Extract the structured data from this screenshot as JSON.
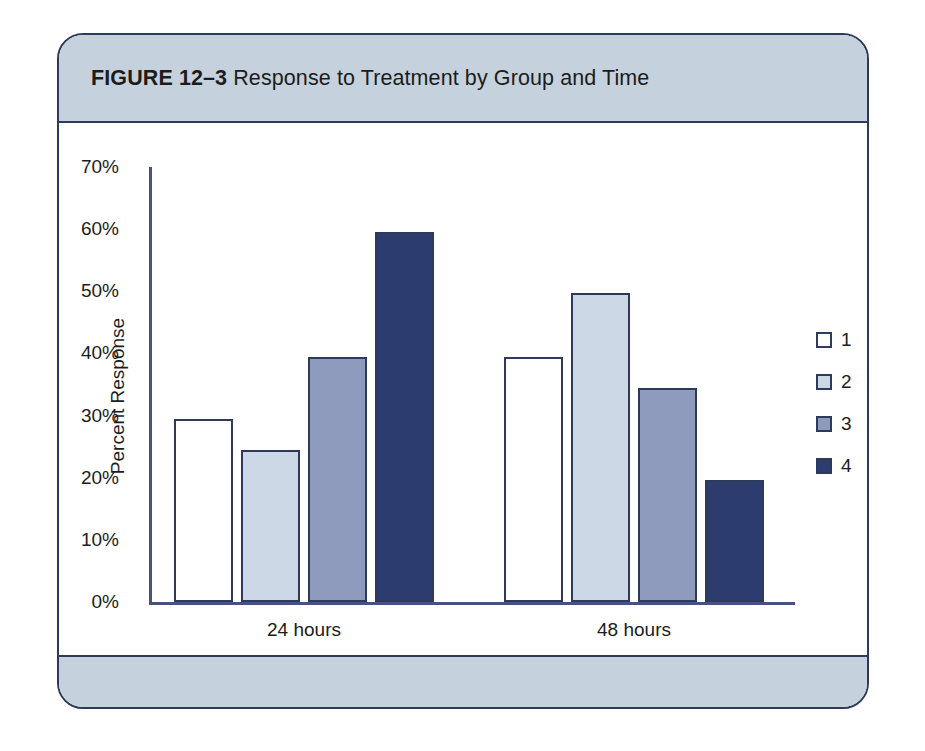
{
  "figure": {
    "label": "FIGURE 12–3",
    "title": "Response to Treatment by Group and Time"
  },
  "chart_data": {
    "type": "bar",
    "title": "Response to Treatment by Group and Time",
    "xlabel": "",
    "ylabel": "Percent Response",
    "ylim": [
      0,
      70
    ],
    "ytick_values": [
      0,
      10,
      20,
      30,
      40,
      50,
      60,
      70
    ],
    "ytick_labels": [
      "0%",
      "10%",
      "20%",
      "30%",
      "40%",
      "50%",
      "60%",
      "70%"
    ],
    "categories": [
      "24 hours",
      "48 hours"
    ],
    "grid": false,
    "legend_position": "right",
    "series": [
      {
        "name": "1",
        "values": [
          29.5,
          39.5
        ],
        "color": "#ffffff",
        "edge_color": "#2e3a5c"
      },
      {
        "name": "2",
        "values": [
          24.5,
          49.8
        ],
        "color": "#ccd8e6",
        "edge_color": "#2e3a5c"
      },
      {
        "name": "3",
        "values": [
          39.5,
          34.5
        ],
        "color": "#8e9bbd",
        "edge_color": "#2e3a5c"
      },
      {
        "name": "4",
        "values": [
          59.5,
          19.7
        ],
        "color": "#2c3c6e",
        "edge_color": "#2e3a5c"
      }
    ]
  },
  "colors": {
    "frame_border": "#2e3a5c",
    "band_background": "#c5d2dd",
    "axis": "#46537d",
    "text": "#1c1c1c"
  }
}
